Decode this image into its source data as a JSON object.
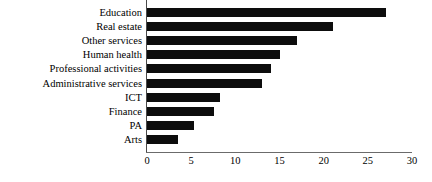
{
  "chart_data": {
    "type": "bar",
    "orientation": "horizontal",
    "title": "",
    "xlabel": "",
    "ylabel": "",
    "xlim": [
      0,
      30
    ],
    "xticks": [
      0,
      5,
      10,
      15,
      20,
      25,
      30
    ],
    "grid": false,
    "legend": false,
    "bar_color": "#0d0d0d",
    "axis_color": "#6b6b6b",
    "categories": [
      "Education",
      "Real estate",
      "Other services",
      "Human health",
      "Professional activities",
      "Administrative services",
      "ICT",
      "Finance",
      "PA",
      "Arts"
    ],
    "values": [
      27,
      21,
      17,
      15,
      14,
      13,
      8.3,
      7.6,
      5.3,
      3.5
    ]
  }
}
